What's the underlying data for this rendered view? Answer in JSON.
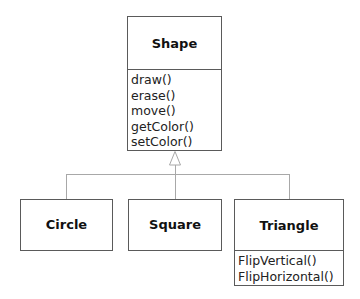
{
  "diagram": {
    "type": "uml-class-inheritance",
    "colors": {
      "box_border": "#5a5a5a",
      "connector": "#a8a8a8",
      "background": "#ffffff",
      "text": "#111111"
    },
    "parent": {
      "name": "Shape",
      "methods": [
        "draw()",
        "erase()",
        "move()",
        "getColor()",
        "setColor()"
      ]
    },
    "children": [
      {
        "name": "Circle",
        "methods": []
      },
      {
        "name": "Square",
        "methods": []
      },
      {
        "name": "Triangle",
        "methods": [
          "FlipVertical()",
          "FlipHorizontal()"
        ]
      }
    ],
    "relationship": {
      "kind": "generalization",
      "arrow_icon": "hollow-triangle-arrow",
      "from": [
        "Circle",
        "Square",
        "Triangle"
      ],
      "to": "Shape"
    }
  }
}
